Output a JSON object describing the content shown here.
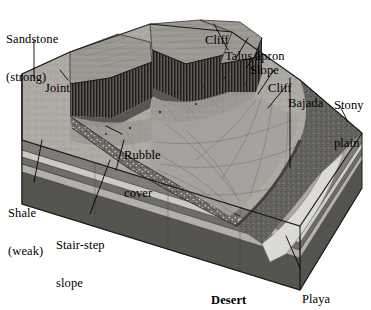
{
  "figure": {
    "caption": "Desert",
    "palette": {
      "background": "#ffffff",
      "ink": "#000000",
      "sandstone_top": "#8f8d88",
      "sandstone_light": "#b4b1ab",
      "sandstone_face": "#6d6b67",
      "shale_dark": "#595754",
      "shale_mid": "#787672",
      "shale_light": "#cfcdc8",
      "cliff_dark": "#3a3937",
      "talus": "#a8a6a0",
      "bajada": "#9d9b96",
      "stony_plain": "#5f5d59",
      "playa": "#d8d6d1",
      "rubble": "#8a8884"
    }
  },
  "labels": {
    "sandstone": {
      "line1": "Sandstone",
      "line2": "(strong)"
    },
    "joint": {
      "line1": "Joint"
    },
    "cliff_top": {
      "line1": "Cliff"
    },
    "talus_apron": {
      "line1": "Talus apron"
    },
    "slope": {
      "line1": "Slope"
    },
    "cliff_right": {
      "line1": "Cliff"
    },
    "bajada": {
      "line1": "Bajada"
    },
    "stony_plain": {
      "line1": "Stony",
      "line2": "plain"
    },
    "rubble_cover": {
      "line1": "Rubble",
      "line2": "cover"
    },
    "shale": {
      "line1": "Shale",
      "line2": "(weak)"
    },
    "stair_step_slope": {
      "line1": "Stair-step",
      "line2": "slope"
    },
    "playa": {
      "line1": "Playa"
    },
    "desert": {
      "line1": "Desert"
    }
  }
}
